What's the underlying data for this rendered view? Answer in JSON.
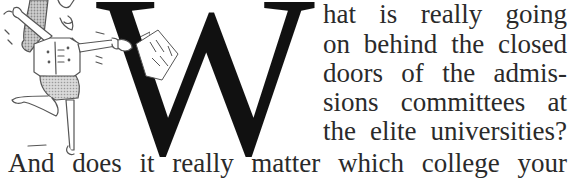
{
  "drop_cap": "W",
  "illustration": {
    "description": "cartoon woman jumping with arms outstretched holding a paper"
  },
  "body_text": {
    "lines": [
      [
        "hat",
        "is",
        "really",
        "going"
      ],
      [
        "on",
        "behind",
        "the",
        "closed"
      ],
      [
        "doors",
        "of",
        "the",
        "admis-"
      ],
      [
        "sions",
        "committees",
        "at"
      ],
      [
        "the",
        "elite",
        "universities?"
      ],
      [
        "And",
        "does",
        "it",
        "really",
        "matter",
        "which",
        "college",
        "your"
      ]
    ]
  }
}
